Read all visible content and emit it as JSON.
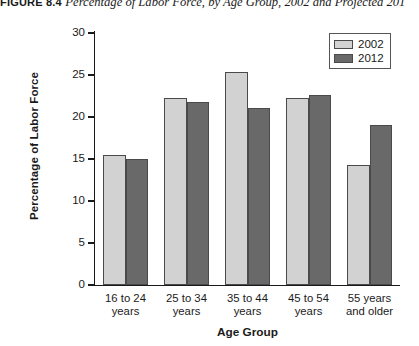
{
  "title": {
    "figure_number": "FIGURE 8.4",
    "caption": "Percentage of Labor Force, by Age Group, 2002 and Projected 201"
  },
  "legend": {
    "position": "top-right",
    "items": [
      {
        "label": "2002",
        "color": "#d2d2d2"
      },
      {
        "label": "2012",
        "color": "#696969"
      }
    ]
  },
  "axes": {
    "ylabel": "Percentage of Labor Force",
    "xlabel": "Age Group",
    "yticks": [
      "0",
      "5",
      "10",
      "15",
      "20",
      "25",
      "30"
    ]
  },
  "chart_data": {
    "type": "bar",
    "title": "Percentage of Labor Force, by Age Group, 2002 and Projected 201",
    "xlabel": "Age Group",
    "ylabel": "Percentage of Labor Force",
    "ylim": [
      0,
      30
    ],
    "ytick_interval": 5,
    "grid": false,
    "legend_position": "top-right",
    "categories": [
      "16 to 24 years",
      "25 to 34 years",
      "35 to 44 years",
      "45 to 54 years",
      "55 years and older"
    ],
    "category_lines": [
      [
        "16 to 24",
        "years"
      ],
      [
        "25 to 34",
        "years"
      ],
      [
        "35 to 44",
        "years"
      ],
      [
        "45 to 54",
        "years"
      ],
      [
        "55 years",
        "and older"
      ]
    ],
    "series": [
      {
        "name": "2002",
        "color": "#d2d2d2",
        "values": [
          15.5,
          22.3,
          25.4,
          22.3,
          14.3
        ]
      },
      {
        "name": "2012",
        "color": "#696969",
        "values": [
          15.0,
          21.8,
          21.1,
          22.6,
          19.0
        ]
      }
    ]
  }
}
